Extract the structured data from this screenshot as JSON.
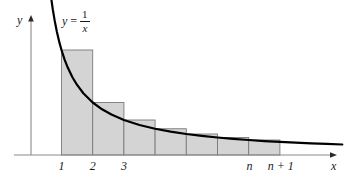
{
  "figure": {
    "curve_label": {
      "lhs": "y",
      "equals": "=",
      "numerator": "1",
      "denominator": "x"
    },
    "axis": {
      "y_label": "y",
      "x_label": "x",
      "origin_x": 31,
      "baseline_y": 155,
      "y_axis_top": 17,
      "x_axis_right": 337
    },
    "tick_labels": [
      {
        "text": "1",
        "x": 61.5,
        "y": 160
      },
      {
        "text": "2",
        "x": 92.7,
        "y": 160
      },
      {
        "text": "3",
        "x": 123.9,
        "y": 160
      },
      {
        "text": "n",
        "x": 249.5,
        "y": 160
      },
      {
        "text": "n + 1",
        "x": 280.7,
        "y": 160
      }
    ],
    "colors": {
      "bar_fill": "#d4d4d4",
      "bar_stroke": "#7a7a7a",
      "curve_stroke": "#000000",
      "axis_stroke": "#8a8a8a",
      "text": "#1a1a1a",
      "background": "#ffffff"
    }
  },
  "chart_data": {
    "type": "area",
    "title": "",
    "subtitle": "",
    "xlabel": "x",
    "ylabel": "y",
    "function": "y = 1/x",
    "xlim": [
      0.55,
      10.3
    ],
    "ylim": [
      0,
      1.28
    ],
    "grid": false,
    "legend": null,
    "curve": {
      "name": "y = 1/x",
      "x": [
        0.67,
        0.72,
        0.78,
        0.85,
        0.93,
        1.0,
        1.1,
        1.2,
        1.35,
        1.5,
        1.7,
        2.0,
        2.3,
        2.6,
        3.0,
        3.5,
        4.0,
        4.5,
        5.0,
        5.5,
        6.0,
        6.5,
        7.0,
        7.5,
        8.0,
        8.5,
        9.0,
        9.5,
        10.0
      ],
      "y": [
        1.493,
        1.389,
        1.282,
        1.176,
        1.075,
        1.0,
        0.909,
        0.833,
        0.741,
        0.667,
        0.588,
        0.5,
        0.435,
        0.385,
        0.333,
        0.286,
        0.25,
        0.222,
        0.2,
        0.182,
        0.167,
        0.154,
        0.143,
        0.133,
        0.125,
        0.118,
        0.111,
        0.105,
        0.1
      ]
    },
    "rectangles": {
      "count": 7,
      "edges": [
        1,
        2,
        3,
        4,
        5,
        6,
        7,
        8
      ],
      "labels": [
        "1",
        "2",
        "3",
        "4",
        "5",
        "6",
        "7"
      ],
      "heights": [
        1.0,
        0.5,
        0.3333,
        0.25,
        0.2,
        0.1667,
        0.1429
      ],
      "height_expressions": [
        "1",
        "1/2",
        "1/3",
        "1/4",
        "1/5",
        "1/6",
        "1/7"
      ]
    },
    "annotations": [
      {
        "text": "y = 1/x",
        "x": 1.3,
        "y": 1.25
      },
      {
        "text": "1",
        "x": 1,
        "y": -0.06
      },
      {
        "text": "2",
        "x": 2,
        "y": -0.06
      },
      {
        "text": "3",
        "x": 3,
        "y": -0.06
      },
      {
        "text": "n",
        "x": 7,
        "y": -0.06
      },
      {
        "text": "n + 1",
        "x": 8,
        "y": -0.06
      }
    ]
  }
}
